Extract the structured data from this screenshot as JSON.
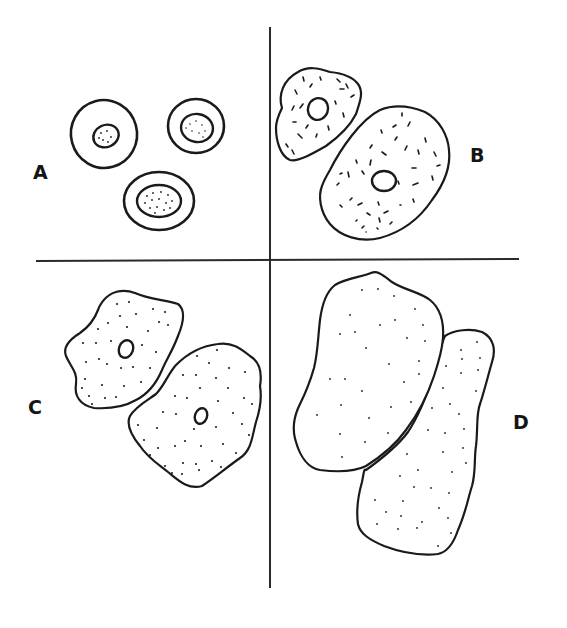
{
  "figure": {
    "colors": {
      "ink": "#1a1a1a",
      "background": "#ffffff"
    },
    "panels": [
      {
        "id": "A",
        "label": "A",
        "position": "top-left",
        "content": "three small round cells with large round stippled nuclei"
      },
      {
        "id": "B",
        "label": "B",
        "position": "top-right",
        "content": "two larger cells with central nucleus and dash-like cytoplasmic granules"
      },
      {
        "id": "C",
        "label": "C",
        "position": "bottom-left",
        "content": "two polygonal cells with small central nucleus and dotted cytoplasm"
      },
      {
        "id": "D",
        "label": "D",
        "position": "bottom-right",
        "content": "two large anucleate overlapping cells with sparse dots"
      }
    ]
  }
}
